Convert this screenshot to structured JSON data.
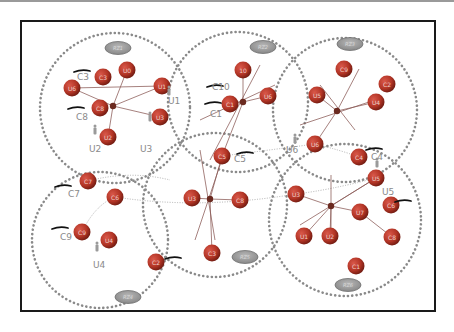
{
  "diagram": {
    "colors": {
      "node_fill": "#c0392b",
      "node_shade": "#7a1c12",
      "zone_dots": "#8a8a8a",
      "oval_fill": "#9a9a9a",
      "oval_stroke": "#6e6e6e",
      "hub_fill": "#6b2a20",
      "edge": "#8a5a55",
      "thin_edge": "#bbbbbb",
      "label": "#8a8a8a"
    },
    "zones": [
      {
        "id": "RZ1",
        "cx": 115,
        "cy": 108,
        "r": 75,
        "oval": {
          "x": 118,
          "y": 48,
          "label": "RZ1"
        }
      },
      {
        "id": "RZ2",
        "cx": 238,
        "cy": 102,
        "r": 70,
        "oval": {
          "x": 263,
          "y": 47,
          "label": "RZ2"
        }
      },
      {
        "id": "RZ3",
        "cx": 345,
        "cy": 110,
        "r": 72,
        "oval": {
          "x": 350,
          "y": 44,
          "label": "RZ3"
        }
      },
      {
        "id": "RZ4",
        "cx": 100,
        "cy": 240,
        "r": 68,
        "oval": {
          "x": 128,
          "y": 297,
          "label": "RZ4"
        }
      },
      {
        "id": "RZ5",
        "cx": 215,
        "cy": 205,
        "r": 72,
        "oval": {
          "x": 245,
          "y": 257,
          "label": "RZ5"
        }
      },
      {
        "id": "RZ6",
        "cx": 345,
        "cy": 220,
        "r": 76,
        "oval": {
          "x": 348,
          "y": 285,
          "label": "RZ6"
        }
      }
    ],
    "nodes": [
      {
        "id": "C3",
        "x": 103,
        "y": 77,
        "label": "C3"
      },
      {
        "id": "U0",
        "x": 127,
        "y": 70,
        "label": "U0"
      },
      {
        "id": "U6",
        "x": 72,
        "y": 88,
        "label": "U6"
      },
      {
        "id": "U1n",
        "x": 162,
        "y": 86,
        "label": "U1"
      },
      {
        "id": "C8",
        "x": 100,
        "y": 108,
        "label": "C8"
      },
      {
        "id": "U3n",
        "x": 160,
        "y": 117,
        "label": "U3"
      },
      {
        "id": "U2n",
        "x": 108,
        "y": 137,
        "label": "U2"
      },
      {
        "id": "C10",
        "x": 243,
        "y": 70,
        "label": "10"
      },
      {
        "id": "C1",
        "x": 230,
        "y": 104,
        "label": "C1"
      },
      {
        "id": "U6b",
        "x": 268,
        "y": 96,
        "label": "U6"
      },
      {
        "id": "C5",
        "x": 222,
        "y": 156,
        "label": "C5"
      },
      {
        "id": "C9b",
        "x": 344,
        "y": 69,
        "label": "C9"
      },
      {
        "id": "C2",
        "x": 387,
        "y": 84,
        "label": "C2"
      },
      {
        "id": "U5a",
        "x": 317,
        "y": 95,
        "label": "U5"
      },
      {
        "id": "U4a",
        "x": 376,
        "y": 102,
        "label": "U4"
      },
      {
        "id": "U6c",
        "x": 315,
        "y": 144,
        "label": "U6"
      },
      {
        "id": "C4",
        "x": 359,
        "y": 157,
        "label": "C4"
      },
      {
        "id": "C7",
        "x": 88,
        "y": 181,
        "label": "C7"
      },
      {
        "id": "C6a",
        "x": 115,
        "y": 197,
        "label": "C6"
      },
      {
        "id": "C9",
        "x": 82,
        "y": 232,
        "label": "C9"
      },
      {
        "id": "U4",
        "x": 109,
        "y": 240,
        "label": "U4"
      },
      {
        "id": "C2b",
        "x": 156,
        "y": 262,
        "label": "C2"
      },
      {
        "id": "U3c",
        "x": 192,
        "y": 198,
        "label": "U3"
      },
      {
        "id": "C8b",
        "x": 240,
        "y": 200,
        "label": "C8"
      },
      {
        "id": "C3b",
        "x": 212,
        "y": 253,
        "label": "C3"
      },
      {
        "id": "U3d",
        "x": 296,
        "y": 194,
        "label": "U3"
      },
      {
        "id": "U5",
        "x": 376,
        "y": 178,
        "label": "U5"
      },
      {
        "id": "C6",
        "x": 391,
        "y": 205,
        "label": "C6"
      },
      {
        "id": "U7",
        "x": 360,
        "y": 212,
        "label": "U7"
      },
      {
        "id": "U1",
        "x": 304,
        "y": 236,
        "label": "U1"
      },
      {
        "id": "U2",
        "x": 330,
        "y": 236,
        "label": "U2"
      },
      {
        "id": "C8c",
        "x": 392,
        "y": 237,
        "label": "C8"
      },
      {
        "id": "C1b",
        "x": 356,
        "y": 266,
        "label": "C1"
      }
    ],
    "hubs": [
      {
        "x": 113,
        "y": 106
      },
      {
        "x": 243,
        "y": 102
      },
      {
        "x": 337,
        "y": 111
      },
      {
        "x": 210,
        "y": 199
      },
      {
        "x": 331,
        "y": 206
      }
    ],
    "edges": [
      [
        113,
        106,
        162,
        86
      ],
      [
        113,
        106,
        72,
        88
      ],
      [
        113,
        106,
        127,
        70
      ],
      [
        113,
        106,
        160,
        117
      ],
      [
        113,
        106,
        108,
        137
      ],
      [
        72,
        88,
        162,
        86
      ],
      [
        243,
        102,
        243,
        70
      ],
      [
        243,
        102,
        268,
        96
      ],
      [
        243,
        102,
        230,
        104
      ],
      [
        243,
        102,
        222,
        156
      ],
      [
        260,
        65,
        210,
        160
      ],
      [
        200,
        120,
        275,
        85
      ],
      [
        337,
        111,
        317,
        95
      ],
      [
        337,
        111,
        376,
        102
      ],
      [
        337,
        111,
        315,
        144
      ],
      [
        337,
        111,
        359,
        69
      ],
      [
        300,
        125,
        375,
        100
      ],
      [
        355,
        130,
        320,
        85
      ],
      [
        210,
        199,
        192,
        198
      ],
      [
        210,
        199,
        240,
        200
      ],
      [
        210,
        199,
        222,
        156
      ],
      [
        210,
        199,
        212,
        253
      ],
      [
        200,
        150,
        215,
        240
      ],
      [
        225,
        150,
        195,
        240
      ],
      [
        331,
        206,
        296,
        194
      ],
      [
        331,
        206,
        376,
        178
      ],
      [
        331,
        206,
        360,
        212
      ],
      [
        331,
        206,
        330,
        236
      ],
      [
        331,
        206,
        304,
        236
      ],
      [
        331,
        175,
        331,
        235
      ],
      [
        300,
        225,
        376,
        178
      ],
      [
        360,
        212,
        392,
        237
      ]
    ],
    "dotted_links": [
      "M 115 197 Q 200 210 296 194",
      "M 296 194 Q 330 190 376 178",
      "M 222 156 Q 270 150 315 144",
      "M 315 144 Q 340 150 359 157",
      "M 115 197 Q 95 205 82 232",
      "M 88 181 Q 130 170 170 180"
    ],
    "external_labels": [
      {
        "text": "C3",
        "x": 77,
        "y": 80
      },
      {
        "text": "C8",
        "x": 76,
        "y": 120
      },
      {
        "text": "U1",
        "x": 168,
        "y": 104
      },
      {
        "text": "U2",
        "x": 89,
        "y": 152
      },
      {
        "text": "U3",
        "x": 140,
        "y": 152
      },
      {
        "text": "C10",
        "x": 212,
        "y": 90
      },
      {
        "text": "C1",
        "x": 210,
        "y": 117
      },
      {
        "text": "C5",
        "x": 234,
        "y": 162
      },
      {
        "text": "U6",
        "x": 286,
        "y": 153
      },
      {
        "text": "C4",
        "x": 371,
        "y": 160
      },
      {
        "text": "U5",
        "x": 382,
        "y": 195
      },
      {
        "text": "C7",
        "x": 68,
        "y": 197
      },
      {
        "text": "C9",
        "x": 60,
        "y": 240
      },
      {
        "text": "U4",
        "x": 93,
        "y": 268
      }
    ],
    "user_icons": [
      {
        "x": 169,
        "y": 92
      },
      {
        "x": 150,
        "y": 118
      },
      {
        "x": 95,
        "y": 131
      },
      {
        "x": 295,
        "y": 140
      },
      {
        "x": 377,
        "y": 164
      },
      {
        "x": 97,
        "y": 248
      }
    ],
    "pen_marks": [
      {
        "x": 82,
        "y": 71
      },
      {
        "x": 76,
        "y": 108
      },
      {
        "x": 215,
        "y": 86
      },
      {
        "x": 213,
        "y": 103
      },
      {
        "x": 245,
        "y": 153
      },
      {
        "x": 374,
        "y": 149
      },
      {
        "x": 403,
        "y": 201
      },
      {
        "x": 63,
        "y": 186
      },
      {
        "x": 60,
        "y": 228
      },
      {
        "x": 173,
        "y": 258
      }
    ]
  }
}
